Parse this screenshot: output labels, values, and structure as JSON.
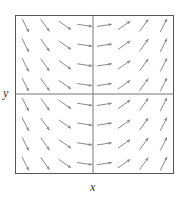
{
  "chart_data": {
    "type": "slope_field",
    "title": "",
    "xlabel": "x",
    "ylabel": "y",
    "grid": false,
    "legend": null,
    "axes_through_origin": true,
    "xlim": [
      -4,
      4
    ],
    "ylim": [
      -4,
      4
    ],
    "columns_x": [
      -3.5,
      -2.5,
      -1.5,
      -0.5,
      0.5,
      1.5,
      2.5,
      3.5
    ],
    "rows_y": [
      3.5,
      2.5,
      1.5,
      0.5,
      -0.5,
      -1.5,
      -2.5,
      -3.5
    ],
    "column_slopes": [
      -2.0,
      -1.4,
      -0.7,
      -0.15,
      0.15,
      0.7,
      1.4,
      2.0
    ]
  },
  "style": {
    "frame_color": "#555555",
    "axis_color": "#777777",
    "arrow_color": "#8a8a8a"
  }
}
